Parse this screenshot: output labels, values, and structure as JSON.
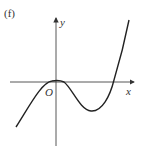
{
  "label": "(f)",
  "axes": {
    "x_label": "x",
    "y_label": "y",
    "origin_label": "O"
  },
  "curve": {
    "description": "cubic curve with double root at origin (local maximum touching O), local minimum to the right, then rising to cross the x-axis",
    "color": "#222222"
  }
}
